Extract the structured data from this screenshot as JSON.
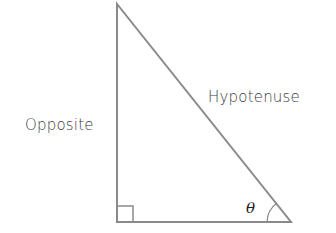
{
  "diagram": {
    "type": "right-triangle",
    "labels": {
      "hypotenuse": "Hypotenuse",
      "opposite": "Opposite",
      "angle": "θ"
    },
    "right_angle_marker": true,
    "colors": {
      "stroke": "#8a8a8a",
      "text": "#3a3a3a"
    }
  }
}
